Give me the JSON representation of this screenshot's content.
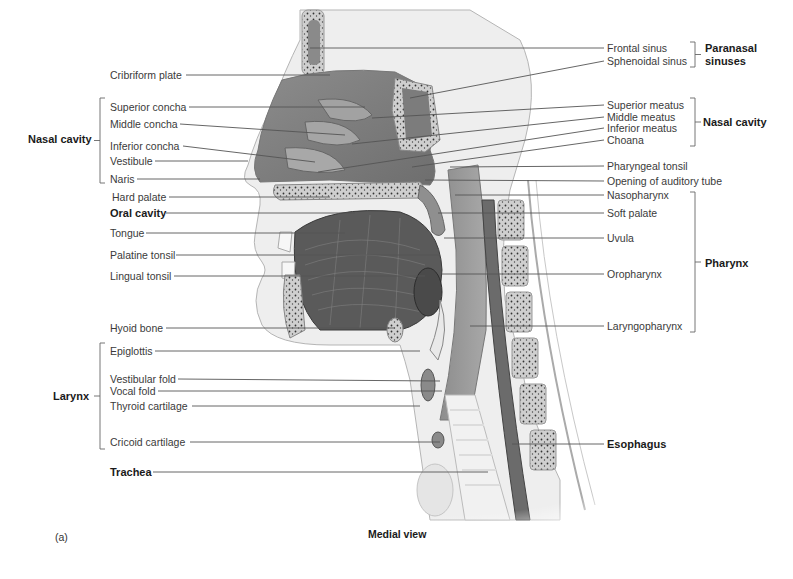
{
  "figure": {
    "panel_label": "(a)",
    "view_caption": "Medial view"
  },
  "left_labels": [
    {
      "text": "Cribriform plate",
      "x": 110,
      "y": 69,
      "bold": false,
      "lx1": 186,
      "ly1": 75,
      "lx2": 330,
      "ly2": 75
    },
    {
      "text": "Superior concha",
      "x": 110,
      "y": 101,
      "bold": false,
      "lx1": 189,
      "ly1": 107,
      "lx2": 365,
      "ly2": 107
    },
    {
      "text": "Middle concha",
      "x": 110,
      "y": 118,
      "bold": false,
      "lx1": 180,
      "ly1": 124,
      "lx2": 345,
      "ly2": 135
    },
    {
      "text": "Inferior concha",
      "x": 110,
      "y": 140,
      "bold": false,
      "lx1": 183,
      "ly1": 146,
      "lx2": 315,
      "ly2": 162
    },
    {
      "text": "Vestibule",
      "x": 110,
      "y": 155,
      "bold": false,
      "lx1": 155,
      "ly1": 161,
      "lx2": 248,
      "ly2": 161
    },
    {
      "text": "Naris",
      "x": 110,
      "y": 173,
      "bold": false,
      "lx1": 137,
      "ly1": 179,
      "lx2": 260,
      "ly2": 179
    },
    {
      "text": "Hard palate",
      "x": 112,
      "y": 191,
      "bold": false,
      "lx1": 169,
      "ly1": 197,
      "lx2": 330,
      "ly2": 197
    },
    {
      "text": "Oral cavity",
      "x": 110,
      "y": 207,
      "bold": true,
      "lx1": 166,
      "ly1": 213,
      "lx2": 355,
      "ly2": 213
    },
    {
      "text": "Tongue",
      "x": 110,
      "y": 227,
      "bold": false,
      "lx1": 146,
      "ly1": 233,
      "lx2": 345,
      "ly2": 233
    },
    {
      "text": "Palatine tonsil",
      "x": 110,
      "y": 249,
      "bold": false,
      "lx1": 176,
      "ly1": 255,
      "lx2": 440,
      "ly2": 255
    },
    {
      "text": "Lingual tonsil",
      "x": 110,
      "y": 270,
      "bold": false,
      "lx1": 174,
      "ly1": 276,
      "lx2": 425,
      "ly2": 276
    },
    {
      "text": "Hyoid bone",
      "x": 110,
      "y": 322,
      "bold": false,
      "lx1": 166,
      "ly1": 328,
      "lx2": 395,
      "ly2": 328
    },
    {
      "text": "Epiglottis",
      "x": 110,
      "y": 345,
      "bold": false,
      "lx1": 155,
      "ly1": 351,
      "lx2": 420,
      "ly2": 351
    },
    {
      "text": "Vestibular fold",
      "x": 110,
      "y": 373,
      "bold": false,
      "lx1": 178,
      "ly1": 379,
      "lx2": 440,
      "ly2": 381
    },
    {
      "text": "Vocal fold",
      "x": 110,
      "y": 385,
      "bold": false,
      "lx1": 158,
      "ly1": 391,
      "lx2": 442,
      "ly2": 391
    },
    {
      "text": "Thyroid cartilage",
      "x": 110,
      "y": 400,
      "bold": false,
      "lx1": 192,
      "ly1": 406,
      "lx2": 420,
      "ly2": 406
    },
    {
      "text": "Cricoid cartilage",
      "x": 110,
      "y": 436,
      "bold": false,
      "lx1": 190,
      "ly1": 442,
      "lx2": 440,
      "ly2": 442
    },
    {
      "text": "Trachea",
      "x": 110,
      "y": 466,
      "bold": true,
      "lx1": 153,
      "ly1": 472,
      "lx2": 488,
      "ly2": 472
    }
  ],
  "right_labels": [
    {
      "text": "Frontal sinus",
      "x": 607,
      "y": 42,
      "bold": false,
      "lx1": 310,
      "ly1": 48,
      "lx2": 604,
      "ly2": 48
    },
    {
      "text": "Sphenoidal sinus",
      "x": 607,
      "y": 55,
      "bold": false,
      "lx1": 410,
      "ly1": 98,
      "lx2": 604,
      "ly2": 61
    },
    {
      "text": "Superior meatus",
      "x": 607,
      "y": 99,
      "bold": false,
      "lx1": 372,
      "ly1": 118,
      "lx2": 604,
      "ly2": 105
    },
    {
      "text": "Middle meatus",
      "x": 607,
      "y": 111,
      "bold": false,
      "lx1": 352,
      "ly1": 144,
      "lx2": 604,
      "ly2": 117
    },
    {
      "text": "Inferior meatus",
      "x": 607,
      "y": 122,
      "bold": false,
      "lx1": 318,
      "ly1": 172,
      "lx2": 604,
      "ly2": 128
    },
    {
      "text": "Choana",
      "x": 607,
      "y": 134,
      "bold": false,
      "lx1": 412,
      "ly1": 167,
      "lx2": 604,
      "ly2": 140
    },
    {
      "text": "Pharyngeal tonsil",
      "x": 607,
      "y": 160,
      "bold": false,
      "lx1": 450,
      "ly1": 167,
      "lx2": 604,
      "ly2": 166
    },
    {
      "text": "Opening of auditory tube",
      "x": 607,
      "y": 175,
      "bold": false,
      "lx1": 425,
      "ly1": 180,
      "lx2": 604,
      "ly2": 181
    },
    {
      "text": "Nasopharynx",
      "x": 607,
      "y": 189,
      "bold": false,
      "lx1": 455,
      "ly1": 195,
      "lx2": 604,
      "ly2": 195
    },
    {
      "text": "Soft palate",
      "x": 607,
      "y": 207,
      "bold": false,
      "lx1": 438,
      "ly1": 213,
      "lx2": 604,
      "ly2": 213
    },
    {
      "text": "Uvula",
      "x": 607,
      "y": 232,
      "bold": false,
      "lx1": 444,
      "ly1": 238,
      "lx2": 604,
      "ly2": 238
    },
    {
      "text": "Oropharynx",
      "x": 607,
      "y": 268,
      "bold": false,
      "lx1": 442,
      "ly1": 274,
      "lx2": 604,
      "ly2": 274
    },
    {
      "text": "Laryngopharynx",
      "x": 607,
      "y": 320,
      "bold": false,
      "lx1": 470,
      "ly1": 326,
      "lx2": 604,
      "ly2": 326
    },
    {
      "text": "Esophagus",
      "x": 607,
      "y": 438,
      "bold": true,
      "lx1": 512,
      "ly1": 444,
      "lx2": 604,
      "ly2": 444
    }
  ],
  "groups": [
    {
      "name": "Nasal cavity",
      "side": "left",
      "x": 28,
      "y": 133,
      "bx": 100,
      "by1": 98,
      "by2": 183
    },
    {
      "name": "Larynx",
      "side": "left",
      "x": 53,
      "y": 390,
      "bx": 100,
      "by1": 343,
      "by2": 449
    },
    {
      "name": "Paranasal sinuses",
      "side": "right",
      "x": 705,
      "y": 42,
      "bx": 695,
      "by1": 42,
      "by2": 67
    },
    {
      "name": "Nasal cavity",
      "side": "right",
      "x": 703,
      "y": 116,
      "bx": 695,
      "by1": 98,
      "by2": 146
    },
    {
      "name": "Pharynx",
      "side": "right",
      "x": 705,
      "y": 257,
      "bx": 695,
      "by1": 192,
      "by2": 332
    }
  ],
  "colors": {
    "text": "#3a3a3a",
    "bold_text": "#1a1a1a",
    "leader_line": "#555555",
    "tissue_light": "#e6e6e6",
    "tissue_mid": "#9a9a9a",
    "tissue_dark": "#6a6a6a",
    "bone": "#c8c8c8",
    "outline": "#8a8a8a"
  }
}
